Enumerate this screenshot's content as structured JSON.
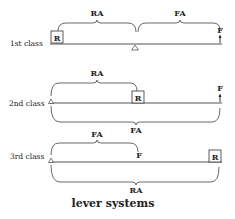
{
  "title": "lever systems",
  "levers": [
    {
      "class_label": "1st class",
      "resistance": "R",
      "force": "F",
      "resistance_arm": "RA",
      "force_arm": "FA"
    },
    {
      "class_label": "2nd class",
      "resistance": "R",
      "force": "F",
      "resistance_arm": "RA",
      "force_arm": "FA"
    },
    {
      "class_label": "3rd class",
      "resistance": "R",
      "force": "F",
      "resistance_arm": "RA",
      "force_arm": "FA"
    }
  ]
}
